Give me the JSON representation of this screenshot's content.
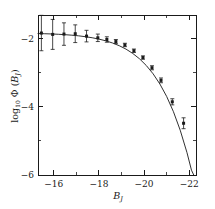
{
  "chart_data": {
    "type": "scatter",
    "title": "",
    "subtitle": "",
    "xlabel": "B_J",
    "xlabel_base": "B",
    "xlabel_sub": "J",
    "ylabel": "log10 Φ (B_J)",
    "ylabel_base": "log",
    "ylabel_base_sub": "10",
    "ylabel_symbol": "Φ",
    "ylabel_arg_open": " (",
    "ylabel_arg": "B",
    "ylabel_arg_sub": "J",
    "ylabel_arg_close": ")",
    "xlim": [
      -15.3,
      -22.3
    ],
    "ylim": [
      -6.0,
      -1.3
    ],
    "x_reversed": true,
    "grid": false,
    "legend": null,
    "xticks": [
      -16,
      -18,
      -20,
      -22
    ],
    "xticklabels": [
      "−16",
      "−18",
      "−20",
      "−22"
    ],
    "xminorticks": [
      -17,
      -19,
      -21
    ],
    "yticks": [
      -2,
      -4,
      -6
    ],
    "yticklabels": [
      "−2",
      "−4",
      "−6"
    ],
    "yminorticks": [
      -3,
      -5
    ],
    "series": [
      {
        "name": "Galaxy luminosity function data",
        "marker": "square",
        "color": "#1a1a1a",
        "points": [
          {
            "x": -15.45,
            "y": -1.83,
            "yerr": 0.52
          },
          {
            "x": -15.95,
            "y": -1.87,
            "yerr": 0.44
          },
          {
            "x": -16.45,
            "y": -1.86,
            "yerr": 0.33
          },
          {
            "x": -16.95,
            "y": -1.85,
            "yerr": 0.26
          },
          {
            "x": -17.45,
            "y": -1.92,
            "yerr": 0.17
          },
          {
            "x": -17.95,
            "y": -1.97,
            "yerr": 0.11
          },
          {
            "x": -18.35,
            "y": -2.02,
            "yerr": 0.08
          },
          {
            "x": -18.75,
            "y": -2.08,
            "yerr": 0.06
          },
          {
            "x": -19.15,
            "y": -2.18,
            "yerr": 0.05
          },
          {
            "x": -19.55,
            "y": -2.35,
            "yerr": 0.05
          },
          {
            "x": -19.95,
            "y": -2.55,
            "yerr": 0.05
          },
          {
            "x": -20.35,
            "y": -2.85,
            "yerr": 0.06
          },
          {
            "x": -20.75,
            "y": -3.22,
            "yerr": 0.07
          },
          {
            "x": -21.25,
            "y": -3.85,
            "yerr": 0.09
          },
          {
            "x": -21.75,
            "y": -4.48,
            "yerr": 0.16
          }
        ]
      }
    ],
    "fit_curve": {
      "name": "Schechter function fit",
      "color": "#1a1a1a",
      "points": [
        {
          "x": -15.3,
          "y": -1.845
        },
        {
          "x": -15.6,
          "y": -1.85
        },
        {
          "x": -15.9,
          "y": -1.857
        },
        {
          "x": -16.2,
          "y": -1.866
        },
        {
          "x": -16.5,
          "y": -1.878
        },
        {
          "x": -16.8,
          "y": -1.893
        },
        {
          "x": -17.1,
          "y": -1.912
        },
        {
          "x": -17.4,
          "y": -1.937
        },
        {
          "x": -17.7,
          "y": -1.968
        },
        {
          "x": -18.0,
          "y": -2.008
        },
        {
          "x": -18.3,
          "y": -2.058
        },
        {
          "x": -18.6,
          "y": -2.122
        },
        {
          "x": -18.9,
          "y": -2.202
        },
        {
          "x": -19.2,
          "y": -2.303
        },
        {
          "x": -19.5,
          "y": -2.43
        },
        {
          "x": -19.8,
          "y": -2.588
        },
        {
          "x": -20.1,
          "y": -2.785
        },
        {
          "x": -20.4,
          "y": -3.028
        },
        {
          "x": -20.7,
          "y": -3.327
        },
        {
          "x": -21.0,
          "y": -3.693
        },
        {
          "x": -21.3,
          "y": -4.14
        },
        {
          "x": -21.6,
          "y": -4.683
        },
        {
          "x": -21.9,
          "y": -5.342
        },
        {
          "x": -22.1,
          "y": -5.86
        },
        {
          "x": -22.2,
          "y": -6.0
        }
      ]
    }
  }
}
